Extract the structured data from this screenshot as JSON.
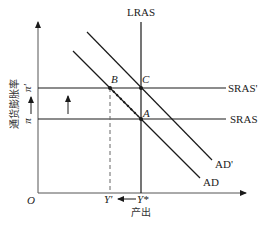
{
  "diagram": {
    "type": "economics-ad-as",
    "y_axis": {
      "label": "通货膨胀率",
      "ticks": [
        "π'",
        "π"
      ]
    },
    "x_axis": {
      "label": "产出",
      "ticks": [
        "Y'",
        "Y*"
      ]
    },
    "origin_label": "O",
    "curves": {
      "lras": "LRAS",
      "sras_new": "SRAS'",
      "sras": "SRAS",
      "ad_new": "AD'",
      "ad": "AD"
    },
    "points": {
      "a": "A",
      "b": "B",
      "c": "C"
    },
    "colors": {
      "line": "#1a1a1a",
      "axis": "#555555",
      "dashed": "#666666"
    }
  }
}
